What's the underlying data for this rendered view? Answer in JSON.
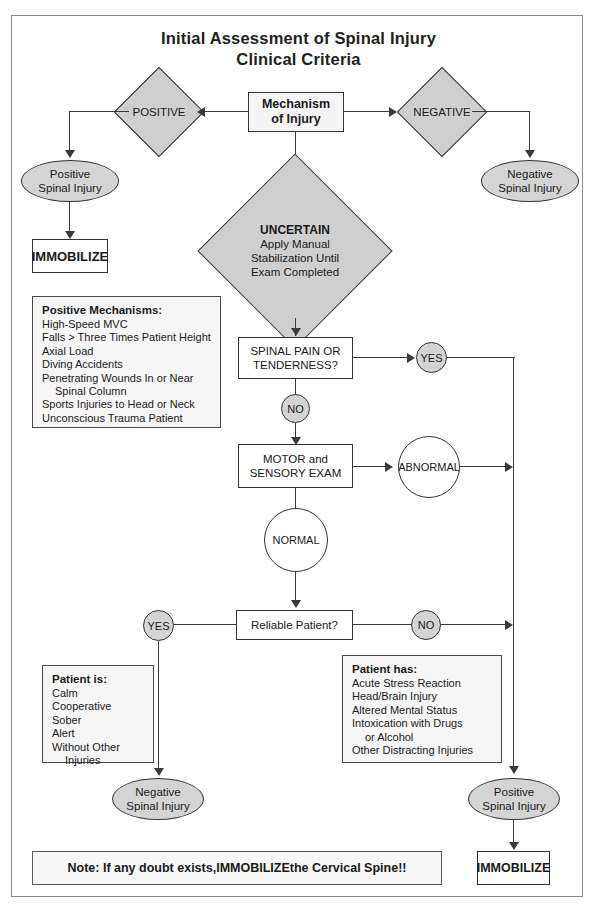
{
  "title": {
    "line1": "Initial Assessment of Spinal Injury",
    "line2": "Clinical Criteria"
  },
  "nodes": {
    "mechanism": "Mechanism\nof Injury",
    "positive_diamond": "POSITIVE",
    "negative_diamond": "NEGATIVE",
    "uncertain_diamond_title": "UNCERTAIN",
    "uncertain_diamond_body": "Apply Manual\nStabilization Until\nExam Completed",
    "positive_spinal_injury_top": "Positive\nSpinal Injury",
    "negative_spinal_injury_top": "Negative\nSpinal Injury",
    "immobilize_top": "IMMOBILIZE",
    "spinal_pain": "SPINAL PAIN OR\nTENDERNESS?",
    "yes_pain": "YES",
    "no_pain": "NO",
    "motor_sensory": "MOTOR and\nSENSORY EXAM",
    "abnormal": "ABNORMAL",
    "normal": "NORMAL",
    "reliable_patient": "Reliable Patient?",
    "yes_reliable": "YES",
    "no_reliable": "NO",
    "negative_spinal_injury_bottom": "Negative\nSpinal Injury",
    "positive_spinal_injury_bottom": "Positive\nSpinal Injury",
    "immobilize_bottom": "IMMOBILIZE"
  },
  "positive_mechanisms": {
    "heading": "Positive Mechanisms:",
    "items": [
      "High-Speed MVC",
      "Falls > Three Times Patient Height",
      "Axial Load",
      "Diving Accidents",
      "Penetrating Wounds In or Near",
      "Spinal Column",
      "Sports Injuries to Head or Neck",
      "Unconscious Trauma Patient"
    ],
    "indent_indexes": [
      5
    ]
  },
  "patient_is": {
    "heading": "Patient is:",
    "items": [
      "Calm",
      "Cooperative",
      "Sober",
      "Alert",
      "Without Other",
      "Injuries"
    ],
    "indent_indexes": [
      5
    ]
  },
  "patient_has": {
    "heading": "Patient has:",
    "items": [
      "Acute Stress Reaction",
      "Head/Brain Injury",
      "Altered Mental Status",
      "Intoxication with Drugs",
      "or Alcohol",
      "Other Distracting Injuries"
    ],
    "indent_indexes": [
      4
    ]
  },
  "note": {
    "prefix": "Note: If any doubt exists, ",
    "emphasis": "IMMOBILIZE",
    "suffix": " the Cervical Spine!!"
  },
  "colors": {
    "fill_gray_dark": "#cfcfcf",
    "fill_gray_oval": "#d4d4d4",
    "fill_box": "#f4f4f4",
    "stroke": "#333333",
    "frame": "#8d8d8d",
    "text": "#1a1a1a"
  }
}
